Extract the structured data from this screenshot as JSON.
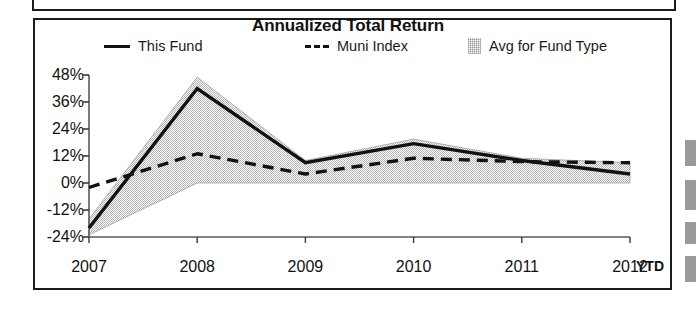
{
  "chart_data": {
    "type": "line",
    "title": "Annualized Total Return",
    "xlabel": "",
    "ylabel": "",
    "categories": [
      "2007",
      "2008",
      "2009",
      "2010",
      "2011",
      "2012"
    ],
    "x_axis_suffix_label": "YTD",
    "ytick_labels": [
      "48%",
      "36%",
      "24%",
      "12%",
      "0%",
      "-12%",
      "-24%"
    ],
    "ytick_values": [
      48,
      36,
      24,
      12,
      0,
      -12,
      -24
    ],
    "ylim": [
      -24,
      48
    ],
    "grid": false,
    "legend_position": "top",
    "series": [
      {
        "name": "This Fund",
        "style": "solid",
        "color": "#111111",
        "values": [
          -20,
          42,
          9,
          17.5,
          10,
          4
        ]
      },
      {
        "name": "Muni Index",
        "style": "dashed",
        "color": "#111111",
        "values": [
          -2,
          13,
          4,
          11,
          9.5,
          9
        ]
      },
      {
        "name": "Avg for Fund Type",
        "style": "band",
        "color": "#c9c9c9",
        "upper": [
          -16,
          47,
          10,
          19.5,
          11,
          9
        ],
        "lower": [
          -23,
          0,
          0,
          0,
          0,
          0
        ]
      }
    ]
  },
  "legend": {
    "fund_label": "This Fund",
    "muni_label": "Muni Index",
    "avg_label": "Avg for Fund Type"
  }
}
